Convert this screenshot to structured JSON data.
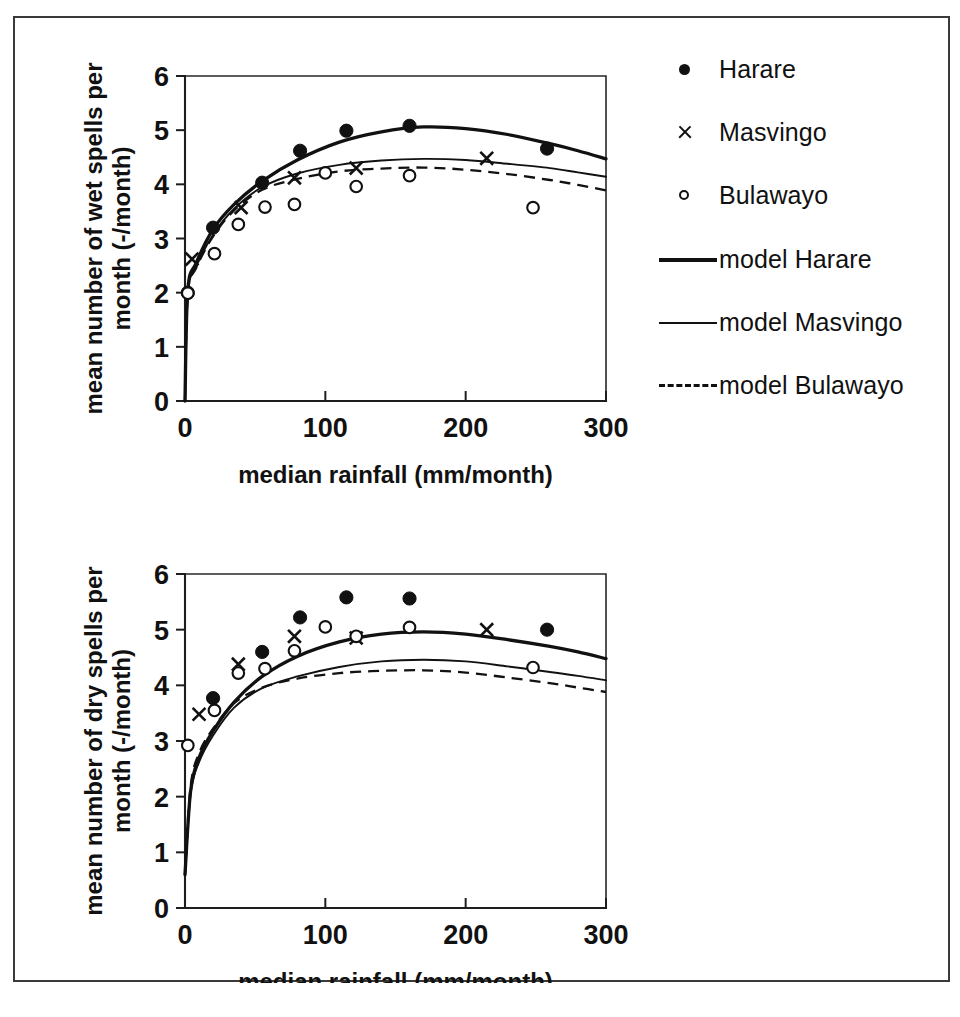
{
  "figure": {
    "border_color": "#3a3a3a",
    "background": "#ffffff"
  },
  "legend": {
    "items": [
      {
        "label": "Harare",
        "marker": "filled-circle-icon"
      },
      {
        "label": "Masvingo",
        "marker": "cross-icon"
      },
      {
        "label": "Bulawayo",
        "marker": "open-circle-icon"
      },
      {
        "label": "model Harare",
        "marker": "solid-thick-line-icon"
      },
      {
        "label": "model Masvingo",
        "marker": "solid-thin-line-icon"
      },
      {
        "label": "model Bulawayo",
        "marker": "dashed-line-icon"
      }
    ]
  },
  "chart_data": [
    {
      "id": "wet-spells",
      "type": "scatter",
      "title": "",
      "xlabel": "median rainfall (mm/month)",
      "ylabel": "mean number of wet spells per month (-/month)",
      "xlim": [
        0,
        300
      ],
      "ylim": [
        0,
        6
      ],
      "xticks": [
        0,
        100,
        200,
        300
      ],
      "yticks": [
        0,
        1,
        2,
        3,
        4,
        5,
        6
      ],
      "grid": false,
      "legend_position": "right",
      "series": [
        {
          "name": "Harare",
          "marker": "filled-circle",
          "points": [
            [
              2,
              2.0
            ],
            [
              20,
              3.2
            ],
            [
              55,
              4.03
            ],
            [
              82,
              4.62
            ],
            [
              115,
              4.99
            ],
            [
              160,
              5.08
            ],
            [
              258,
              4.66
            ]
          ]
        },
        {
          "name": "Masvingo",
          "marker": "cross",
          "points": [
            [
              5,
              2.62
            ],
            [
              40,
              3.57
            ],
            [
              78,
              4.12
            ],
            [
              122,
              4.3
            ],
            [
              215,
              4.48
            ]
          ]
        },
        {
          "name": "Bulawayo",
          "marker": "open-circle",
          "points": [
            [
              2,
              1.99
            ],
            [
              21,
              2.72
            ],
            [
              38,
              3.26
            ],
            [
              57,
              3.58
            ],
            [
              78,
              3.63
            ],
            [
              100,
              4.21
            ],
            [
              122,
              3.96
            ],
            [
              160,
              4.16
            ],
            [
              248,
              3.57
            ]
          ]
        },
        {
          "name": "model Harare",
          "line": "solid-thick",
          "points": [
            [
              0,
              0
            ],
            [
              2,
              2.05
            ],
            [
              8,
              2.55
            ],
            [
              20,
              3.17
            ],
            [
              35,
              3.63
            ],
            [
              55,
              4.06
            ],
            [
              80,
              4.45
            ],
            [
              110,
              4.78
            ],
            [
              140,
              4.97
            ],
            [
              170,
              5.06
            ],
            [
              200,
              5.03
            ],
            [
              230,
              4.92
            ],
            [
              260,
              4.75
            ],
            [
              280,
              4.62
            ],
            [
              300,
              4.47
            ]
          ]
        },
        {
          "name": "model Masvingo",
          "line": "solid-thin",
          "points": [
            [
              0,
              0
            ],
            [
              2,
              1.98
            ],
            [
              8,
              2.48
            ],
            [
              20,
              3.07
            ],
            [
              35,
              3.55
            ],
            [
              55,
              3.95
            ],
            [
              80,
              4.2
            ],
            [
              110,
              4.36
            ],
            [
              140,
              4.44
            ],
            [
              170,
              4.47
            ],
            [
              200,
              4.45
            ],
            [
              230,
              4.38
            ],
            [
              260,
              4.3
            ],
            [
              280,
              4.22
            ],
            [
              300,
              4.14
            ]
          ]
        },
        {
          "name": "model Bulawayo",
          "line": "dashed",
          "points": [
            [
              0,
              0
            ],
            [
              2,
              1.98
            ],
            [
              8,
              2.46
            ],
            [
              20,
              3.04
            ],
            [
              35,
              3.52
            ],
            [
              55,
              3.9
            ],
            [
              80,
              4.1
            ],
            [
              110,
              4.24
            ],
            [
              140,
              4.29
            ],
            [
              170,
              4.31
            ],
            [
              200,
              4.27
            ],
            [
              230,
              4.19
            ],
            [
              260,
              4.08
            ],
            [
              280,
              3.99
            ],
            [
              300,
              3.89
            ]
          ]
        }
      ]
    },
    {
      "id": "dry-spells",
      "type": "scatter",
      "title": "",
      "xlabel": "median rainfall (mm/month)",
      "ylabel": "mean number of dry spells per month (-/month)",
      "xlim": [
        0,
        300
      ],
      "ylim": [
        0,
        6
      ],
      "xticks": [
        0,
        100,
        200,
        300
      ],
      "yticks": [
        0,
        1,
        2,
        3,
        4,
        5,
        6
      ],
      "grid": false,
      "legend_position": "right",
      "series": [
        {
          "name": "Harare",
          "marker": "filled-circle",
          "points": [
            [
              20,
              3.77
            ],
            [
              55,
              4.6
            ],
            [
              82,
              5.22
            ],
            [
              115,
              5.58
            ],
            [
              160,
              5.56
            ],
            [
              258,
              5.0
            ]
          ]
        },
        {
          "name": "Masvingo",
          "marker": "cross",
          "points": [
            [
              10,
              3.48
            ],
            [
              38,
              4.38
            ],
            [
              78,
              4.88
            ],
            [
              122,
              4.85
            ],
            [
              215,
              5.0
            ]
          ]
        },
        {
          "name": "Bulawayo",
          "marker": "open-circle",
          "points": [
            [
              2,
              2.92
            ],
            [
              21,
              3.55
            ],
            [
              38,
              4.22
            ],
            [
              57,
              4.3
            ],
            [
              78,
              4.62
            ],
            [
              100,
              5.05
            ],
            [
              122,
              4.88
            ],
            [
              160,
              5.04
            ],
            [
              248,
              4.32
            ]
          ]
        },
        {
          "name": "model Harare",
          "line": "solid-thick",
          "points": [
            [
              0,
              0.6
            ],
            [
              4,
              2.1
            ],
            [
              10,
              2.7
            ],
            [
              20,
              3.18
            ],
            [
              35,
              3.7
            ],
            [
              55,
              4.16
            ],
            [
              80,
              4.52
            ],
            [
              110,
              4.78
            ],
            [
              140,
              4.92
            ],
            [
              170,
              4.96
            ],
            [
              200,
              4.92
            ],
            [
              230,
              4.82
            ],
            [
              260,
              4.7
            ],
            [
              280,
              4.6
            ],
            [
              300,
              4.48
            ]
          ]
        },
        {
          "name": "model Masvingo",
          "line": "solid-thin",
          "points": [
            [
              0,
              0.6
            ],
            [
              4,
              2.05
            ],
            [
              10,
              2.62
            ],
            [
              20,
              3.1
            ],
            [
              35,
              3.6
            ],
            [
              55,
              3.95
            ],
            [
              80,
              4.16
            ],
            [
              110,
              4.33
            ],
            [
              140,
              4.43
            ],
            [
              170,
              4.46
            ],
            [
              200,
              4.43
            ],
            [
              230,
              4.34
            ],
            [
              260,
              4.24
            ],
            [
              280,
              4.17
            ],
            [
              300,
              4.09
            ]
          ]
        },
        {
          "name": "model Bulawayo",
          "line": "dashed",
          "points": [
            [
              0,
              0.6
            ],
            [
              4,
              2.18
            ],
            [
              10,
              2.78
            ],
            [
              20,
              3.22
            ],
            [
              35,
              3.68
            ],
            [
              55,
              3.96
            ],
            [
              80,
              4.12
            ],
            [
              110,
              4.22
            ],
            [
              140,
              4.26
            ],
            [
              170,
              4.27
            ],
            [
              200,
              4.23
            ],
            [
              230,
              4.14
            ],
            [
              260,
              4.04
            ],
            [
              280,
              3.96
            ],
            [
              300,
              3.88
            ]
          ]
        }
      ]
    }
  ]
}
